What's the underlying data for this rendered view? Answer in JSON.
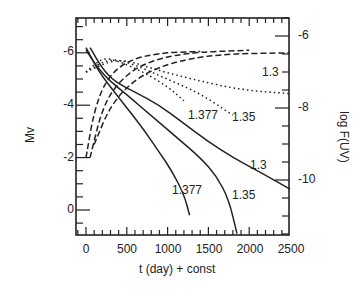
{
  "chart_data": {
    "type": "line",
    "title": "",
    "xlabel": "t (day) + const",
    "ylabel_left": "Mv",
    "ylabel_right": "log F(UV)",
    "xlim": [
      -100,
      2500
    ],
    "ylim_left": [
      1,
      -7.2
    ],
    "ylim_right": [
      -5.0,
      -11.5
    ],
    "x_ticks": [
      "0",
      "500",
      "1000",
      "1500",
      "2000",
      "2500"
    ],
    "y_left_ticks": [
      "-6",
      "-4",
      "-2",
      "0"
    ],
    "y_right_ticks": [
      "-6",
      "-8",
      "-10"
    ],
    "legend": "none (curves labeled directly by white dwarf mass)",
    "series": [
      {
        "name": "1.377",
        "style": "solid",
        "axis": "left",
        "quantity": "Mv",
        "points": [
          [
            0,
            -6.2
          ],
          [
            100,
            -5.6
          ],
          [
            200,
            -5.1
          ],
          [
            350,
            -4.5
          ],
          [
            500,
            -3.9
          ],
          [
            700,
            -3.1
          ],
          [
            900,
            -2.2
          ],
          [
            1050,
            -1.5
          ],
          [
            1200,
            -0.6
          ],
          [
            1270,
            0.2
          ]
        ]
      },
      {
        "name": "1.35",
        "style": "solid",
        "axis": "left",
        "quantity": "Mv",
        "points": [
          [
            0,
            -6.1
          ],
          [
            150,
            -5.4
          ],
          [
            300,
            -4.9
          ],
          [
            500,
            -4.4
          ],
          [
            800,
            -3.6
          ],
          [
            1100,
            -2.8
          ],
          [
            1400,
            -2.0
          ],
          [
            1600,
            -1.3
          ],
          [
            1750,
            -0.4
          ],
          [
            1850,
            0.9
          ]
        ]
      },
      {
        "name": "1.3",
        "style": "solid",
        "axis": "left",
        "quantity": "Mv",
        "points": [
          [
            50,
            -6.2
          ],
          [
            200,
            -5.4
          ],
          [
            350,
            -4.9
          ],
          [
            600,
            -4.5
          ],
          [
            900,
            -4.0
          ],
          [
            1200,
            -3.3
          ],
          [
            1500,
            -2.6
          ],
          [
            1800,
            -2.0
          ],
          [
            2100,
            -1.5
          ],
          [
            2500,
            -0.8
          ]
        ]
      },
      {
        "name": "1.377 (UV)",
        "style": "dotted",
        "axis": "right",
        "quantity": "log F(UV)",
        "points": [
          [
            0,
            -7.0
          ],
          [
            200,
            -6.6
          ],
          [
            400,
            -6.7
          ],
          [
            700,
            -7.0
          ],
          [
            1000,
            -7.4
          ],
          [
            1200,
            -7.8
          ]
        ]
      },
      {
        "name": "1.35 (UV)",
        "style": "dotted",
        "axis": "right",
        "quantity": "log F(UV)",
        "points": [
          [
            0,
            -7.0
          ],
          [
            300,
            -6.6
          ],
          [
            600,
            -6.8
          ],
          [
            1000,
            -7.2
          ],
          [
            1400,
            -7.6
          ],
          [
            1800,
            -8.2
          ]
        ]
      },
      {
        "name": "1.3 (UV)",
        "style": "dotted",
        "axis": "right",
        "quantity": "log F(UV)",
        "points": [
          [
            0,
            -7.0
          ],
          [
            400,
            -6.6
          ],
          [
            800,
            -6.9
          ],
          [
            1300,
            -7.2
          ],
          [
            1900,
            -7.5
          ],
          [
            2500,
            -7.6
          ]
        ]
      },
      {
        "name": "1.377 (V rise)",
        "style": "dashed",
        "axis": "left",
        "quantity": "Mv",
        "points": [
          [
            0,
            -2.0
          ],
          [
            100,
            -3.8
          ],
          [
            250,
            -5.0
          ],
          [
            500,
            -5.7
          ],
          [
            900,
            -6.0
          ],
          [
            1400,
            -6.05
          ]
        ]
      },
      {
        "name": "1.35 (V rise)",
        "style": "dashed",
        "axis": "left",
        "quantity": "Mv",
        "points": [
          [
            50,
            -2.0
          ],
          [
            200,
            -3.9
          ],
          [
            400,
            -4.9
          ],
          [
            700,
            -5.6
          ],
          [
            1200,
            -6.0
          ],
          [
            2000,
            -6.1
          ]
        ]
      },
      {
        "name": "1.3 (V rise)",
        "style": "dashed",
        "axis": "left",
        "quantity": "Mv",
        "points": [
          [
            100,
            -2.5
          ],
          [
            300,
            -4.0
          ],
          [
            600,
            -5.0
          ],
          [
            1000,
            -5.6
          ],
          [
            1600,
            -5.95
          ],
          [
            2500,
            -6.0
          ]
        ]
      }
    ],
    "annotations": [
      {
        "text": "1.377",
        "x": 1230,
        "y_left": -1.2,
        "near": "solid"
      },
      {
        "text": "1.35",
        "x": 1820,
        "y_left": -1.4,
        "near": "solid"
      },
      {
        "text": "1.3",
        "x": 2320,
        "y_left": -2.4,
        "near": "solid"
      },
      {
        "text": "1.377",
        "x": 1370,
        "y_left": -4.6,
        "near": "dotted"
      },
      {
        "text": "1.35",
        "x": 1900,
        "y_left": -4.5,
        "near": "dotted"
      },
      {
        "text": "1.3",
        "x": 2400,
        "y_left": -5.3,
        "near": "dotted"
      }
    ],
    "grid": false
  },
  "labels": {
    "xlabel": "t (day) + const",
    "ylabel_left": "Mv",
    "ylabel_right": "log F(UV)",
    "x_ticks": [
      "0",
      "500",
      "1000",
      "1500",
      "2000",
      "2500"
    ],
    "y_left_ticks": [
      "-6",
      "-4",
      "-2",
      "0"
    ],
    "y_right_ticks": [
      "-6",
      "-8",
      "-10"
    ],
    "ann": [
      "1.377",
      "1.35",
      "1.3",
      "1.377",
      "1.35",
      "1.3"
    ]
  }
}
